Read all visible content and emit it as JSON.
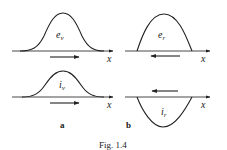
{
  "figure": {
    "caption": "Fig. 1.4",
    "panels": {
      "a": {
        "label": "a",
        "top": {
          "symbol": "e",
          "subscript": "v",
          "axis_label": "x",
          "shape": "bell (positive pulse)",
          "direction": "right"
        },
        "bottom": {
          "symbol": "i",
          "subscript": "v",
          "axis_label": "x",
          "shape": "bell (positive pulse)",
          "direction": "right"
        }
      },
      "b": {
        "label": "b",
        "top": {
          "symbol": "e",
          "subscript": "r",
          "axis_label": "x",
          "shape": "arch (positive pulse)",
          "direction": "left"
        },
        "bottom": {
          "symbol": "i",
          "subscript": "r",
          "axis_label": "x",
          "shape": "inverted arch (negative pulse)",
          "direction": "left"
        }
      }
    }
  },
  "colors": {
    "ink": "#222222",
    "background": "#ffffff"
  }
}
